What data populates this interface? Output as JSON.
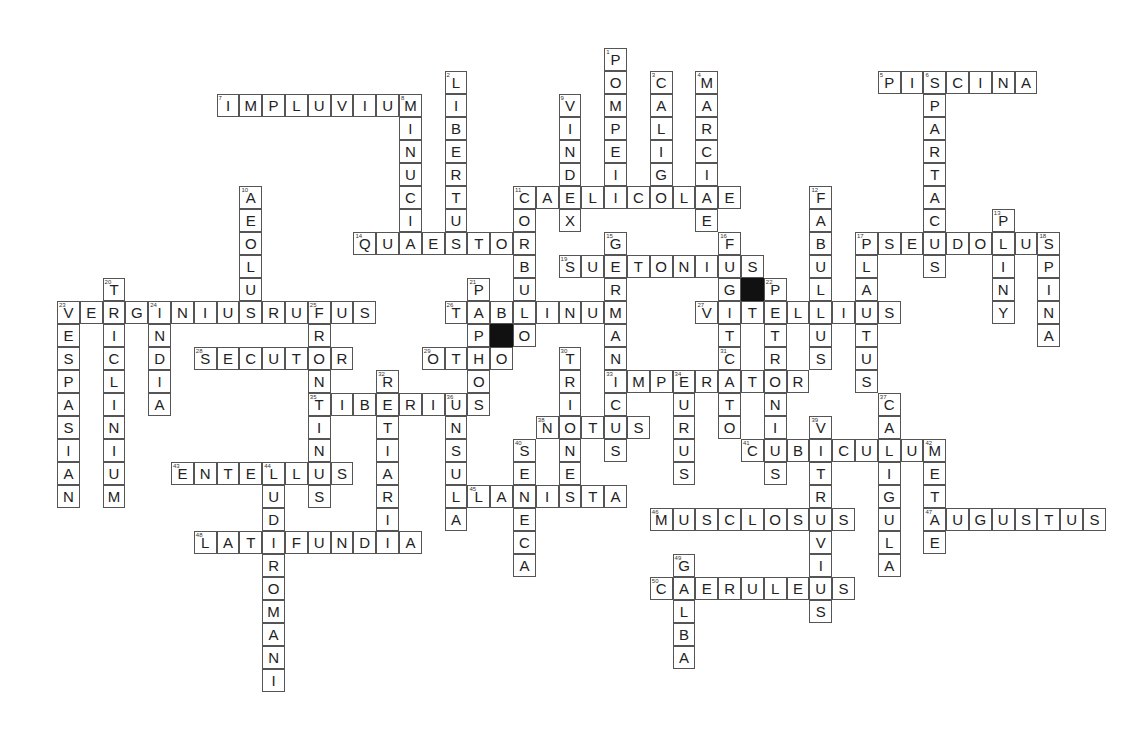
{
  "puzzle": {
    "grid": {
      "x0": 57,
      "y0": 48,
      "cell_w": 22.8,
      "cell_h": 23
    },
    "words": [
      {
        "num": 1,
        "answer": "POMPEII",
        "dir": "down",
        "col": 24,
        "row": 0
      },
      {
        "num": 2,
        "answer": "LIBERTUS",
        "dir": "down",
        "col": 17,
        "row": 1
      },
      {
        "num": 3,
        "answer": "CALIGO",
        "dir": "down",
        "col": 26,
        "row": 1
      },
      {
        "num": 4,
        "answer": "MARCIAE",
        "dir": "down",
        "col": 28,
        "row": 1
      },
      {
        "num": 5,
        "answer": "PISCINA",
        "dir": "across",
        "col": 36,
        "row": 1
      },
      {
        "num": 6,
        "answer": "SPARTACUS",
        "dir": "down",
        "col": 38,
        "row": 1
      },
      {
        "num": 7,
        "answer": "IMPLUVIUM",
        "dir": "across",
        "col": 7,
        "row": 2
      },
      {
        "num": 8,
        "answer": "MINUCIA",
        "dir": "down",
        "col": 15,
        "row": 2
      },
      {
        "num": 9,
        "answer": "VINDEX",
        "dir": "down",
        "col": 22,
        "row": 2
      },
      {
        "num": 10,
        "answer": "AEOLUS",
        "dir": "down",
        "col": 8,
        "row": 6
      },
      {
        "num": 11,
        "answer": "CAELICOLAE",
        "dir": "across",
        "col": 20,
        "row": 6
      },
      {
        "num": 11,
        "answer": "CORBULO",
        "dir": "down",
        "col": 20,
        "row": 6
      },
      {
        "num": 12,
        "answer": "FABULLUS",
        "dir": "down",
        "col": 33,
        "row": 6
      },
      {
        "num": 13,
        "answer": "PLINY",
        "dir": "down",
        "col": 41,
        "row": 7
      },
      {
        "num": 14,
        "answer": "QUAESTOR",
        "dir": "across",
        "col": 13,
        "row": 8
      },
      {
        "num": 15,
        "answer": "GERMANICUS",
        "dir": "down",
        "col": 24,
        "row": 8
      },
      {
        "num": 16,
        "answer": "FUGIT",
        "dir": "down",
        "col": 29,
        "row": 8
      },
      {
        "num": 17,
        "answer": "PSEUDOLUS",
        "dir": "across",
        "col": 35,
        "row": 8
      },
      {
        "num": 17,
        "answer": "PLAUTUS",
        "dir": "down",
        "col": 35,
        "row": 8
      },
      {
        "num": 18,
        "answer": "SPINA",
        "dir": "down",
        "col": 43,
        "row": 8
      },
      {
        "num": 19,
        "answer": "SUETONIUS",
        "dir": "across",
        "col": 22,
        "row": 9
      },
      {
        "num": 20,
        "answer": "TRICLINIUM",
        "dir": "down",
        "col": 2,
        "row": 10
      },
      {
        "num": 21,
        "answer": "PAPHOS",
        "dir": "down",
        "col": 18,
        "row": 10
      },
      {
        "num": 22,
        "answer": "PETRONIUS",
        "dir": "down",
        "col": 31,
        "row": 10
      },
      {
        "num": 23,
        "answer": "VERGINIUSRUFUS",
        "dir": "across",
        "col": 0,
        "row": 11
      },
      {
        "num": 23,
        "answer": "VESPASIAN",
        "dir": "down",
        "col": 0,
        "row": 11
      },
      {
        "num": 24,
        "answer": "INDIA",
        "dir": "down",
        "col": 4,
        "row": 11
      },
      {
        "num": 25,
        "answer": "FRONTINUS",
        "dir": "down",
        "col": 11,
        "row": 11
      },
      {
        "num": 26,
        "answer": "TABLINUM",
        "dir": "across",
        "col": 17,
        "row": 11
      },
      {
        "num": 27,
        "answer": "VITELLIUS",
        "dir": "across",
        "col": 28,
        "row": 11
      },
      {
        "num": 28,
        "answer": "SECUTOR",
        "dir": "across",
        "col": 6,
        "row": 13
      },
      {
        "num": 29,
        "answer": "OTHO",
        "dir": "across",
        "col": 16,
        "row": 13
      },
      {
        "num": 30,
        "answer": "TRIONES",
        "dir": "down",
        "col": 22,
        "row": 13
      },
      {
        "num": 31,
        "answer": "CATO",
        "dir": "down",
        "col": 29,
        "row": 13
      },
      {
        "num": 32,
        "answer": "RETIARII",
        "dir": "down",
        "col": 14,
        "row": 14
      },
      {
        "num": 33,
        "answer": "IMPERATOR",
        "dir": "across",
        "col": 24,
        "row": 14
      },
      {
        "num": 34,
        "answer": "EURUS",
        "dir": "down",
        "col": 27,
        "row": 14
      },
      {
        "num": 35,
        "answer": "TIBERIUS",
        "dir": "across",
        "col": 11,
        "row": 15
      },
      {
        "num": 36,
        "answer": "INSULA",
        "dir": "down",
        "col": 17,
        "row": 15
      },
      {
        "num": 37,
        "answer": "CALIGULA",
        "dir": "down",
        "col": 36,
        "row": 15
      },
      {
        "num": 38,
        "answer": "NOTUS",
        "dir": "across",
        "col": 21,
        "row": 16
      },
      {
        "num": 39,
        "answer": "VITRUVIUS",
        "dir": "down",
        "col": 33,
        "row": 16
      },
      {
        "num": 40,
        "answer": "SENECA",
        "dir": "down",
        "col": 20,
        "row": 17
      },
      {
        "num": 41,
        "answer": "CUBICULUM",
        "dir": "across",
        "col": 30,
        "row": 17
      },
      {
        "num": 42,
        "answer": "METAE",
        "dir": "down",
        "col": 38,
        "row": 17
      },
      {
        "num": 43,
        "answer": "ENTELLUS",
        "dir": "across",
        "col": 5,
        "row": 18
      },
      {
        "num": 44,
        "answer": "LUDIROMANI",
        "dir": "down",
        "col": 9,
        "row": 18
      },
      {
        "num": 45,
        "answer": "LANISTA",
        "dir": "across",
        "col": 18,
        "row": 19
      },
      {
        "num": 46,
        "answer": "MUSCLOSUS",
        "dir": "across",
        "col": 26,
        "row": 20
      },
      {
        "num": 47,
        "answer": "AUGUSTUS",
        "dir": "across",
        "col": 38,
        "row": 20
      },
      {
        "num": 48,
        "answer": "LATIFUNDIA",
        "dir": "across",
        "col": 6,
        "row": 21
      },
      {
        "num": 49,
        "answer": "GALBA",
        "dir": "down",
        "col": 27,
        "row": 22
      },
      {
        "num": 50,
        "answer": "CAERULEUS",
        "dir": "across",
        "col": 26,
        "row": 23
      }
    ],
    "black_cells": [
      {
        "col": 19,
        "row": 12
      },
      {
        "col": 30,
        "row": 10
      }
    ],
    "colors": {
      "border": "#555555",
      "text": "#222222",
      "black": "#111111",
      "background": "#ffffff"
    }
  }
}
